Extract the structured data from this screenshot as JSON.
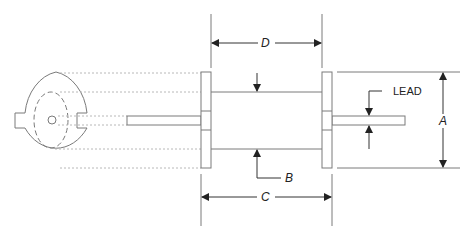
{
  "diagram": {
    "labels": {
      "D": "D",
      "C": "C",
      "B": "B",
      "A": "A",
      "lead": "LEAD"
    },
    "colors": {
      "line": "#7a7a7a",
      "dotted": "#b8b8b8",
      "arrow": "#222222",
      "text": "#222222"
    }
  }
}
